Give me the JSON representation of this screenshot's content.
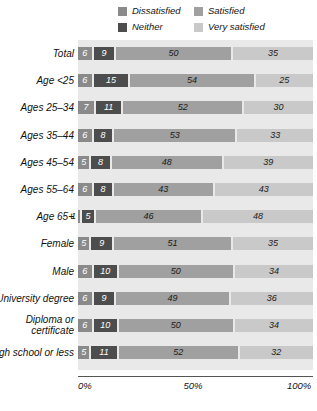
{
  "chart_data": {
    "type": "bar",
    "orientation": "horizontal",
    "stacked": true,
    "normalized_percent": true,
    "title": "",
    "subtitle": "",
    "xlabel": "",
    "ylabel": "",
    "xlim": [
      0,
      100
    ],
    "grid": false,
    "legend_position": "top",
    "colors": {
      "dissatisfied": "#8a8a8a",
      "neither": "#4d4d4d",
      "satisfied": "#a0a0a0",
      "very_satisfied": "#c9c9c9",
      "plot_background": "#e9e9e9",
      "axis_line": "#555555",
      "bar_gap": "#ffffff"
    },
    "series": [
      {
        "name": "Dissatisfied",
        "key": "dissatisfied",
        "color": "#8a8a8a",
        "values": [
          6,
          6,
          7,
          6,
          5,
          6,
          1,
          5,
          6,
          6,
          6,
          5
        ]
      },
      {
        "name": "Neither",
        "key": "neither",
        "color": "#4d4d4d",
        "values": [
          9,
          15,
          11,
          8,
          8,
          8,
          5,
          9,
          10,
          9,
          10,
          11
        ]
      },
      {
        "name": "Satisfied",
        "key": "satisfied",
        "color": "#a0a0a0",
        "values": [
          50,
          54,
          52,
          53,
          48,
          43,
          46,
          51,
          50,
          49,
          50,
          52
        ]
      },
      {
        "name": "Very satisfied",
        "key": "very_satisfied",
        "color": "#c9c9c9",
        "values": [
          35,
          25,
          30,
          33,
          39,
          43,
          48,
          35,
          34,
          36,
          34,
          32
        ]
      }
    ],
    "categories": [
      "Total",
      "Age <25",
      "Ages 25–34",
      "Ages 35–44",
      "Ages 45–54",
      "Ages 55–64",
      "Age 65+",
      "Female",
      "Male",
      "University degree",
      "Diploma or\ncertificate",
      "High school or less"
    ],
    "xticks": [
      0,
      50,
      100
    ],
    "xticklabels": [
      "0%",
      "50%",
      "100%"
    ]
  },
  "legend": {
    "items": [
      {
        "label": "Dissatisfied",
        "swatch_name": "legend-swatch-dissatisfied",
        "color": "#8a8a8a"
      },
      {
        "label": "Satisfied",
        "swatch_name": "legend-swatch-satisfied",
        "color": "#a0a0a0"
      },
      {
        "label": "Neither",
        "swatch_name": "legend-swatch-neither",
        "color": "#4d4d4d"
      },
      {
        "label": "Very satisfied",
        "swatch_name": "legend-swatch-very-satisfied",
        "color": "#c9c9c9"
      }
    ]
  },
  "rows": [
    {
      "label": "Total",
      "values": [
        6,
        9,
        50,
        35
      ],
      "outside_first": false
    },
    {
      "label": "Age <25",
      "values": [
        6,
        15,
        54,
        25
      ],
      "outside_first": false
    },
    {
      "label": "Ages 25–34",
      "values": [
        7,
        11,
        52,
        30
      ],
      "outside_first": false
    },
    {
      "label": "Ages 35–44",
      "values": [
        6,
        8,
        53,
        33
      ],
      "outside_first": false
    },
    {
      "label": "Ages 45–54",
      "values": [
        5,
        8,
        48,
        39
      ],
      "outside_first": false
    },
    {
      "label": "Ages 55–64",
      "values": [
        6,
        8,
        43,
        43
      ],
      "outside_first": false
    },
    {
      "label": "Age 65+",
      "values": [
        1,
        5,
        46,
        48
      ],
      "outside_first": true
    },
    {
      "label": "Female",
      "values": [
        5,
        9,
        51,
        35
      ],
      "outside_first": false
    },
    {
      "label": "Male",
      "values": [
        6,
        10,
        50,
        34
      ],
      "outside_first": false
    },
    {
      "label": "University degree",
      "values": [
        6,
        9,
        49,
        36
      ],
      "outside_first": false
    },
    {
      "label": "Diploma or\ncertificate",
      "values": [
        6,
        10,
        50,
        34
      ],
      "outside_first": false
    },
    {
      "label": "High school or less",
      "values": [
        5,
        11,
        52,
        32
      ],
      "outside_first": false
    }
  ],
  "axis": {
    "ticks": [
      {
        "label": "0%",
        "value": 0
      },
      {
        "label": "50%",
        "value": 50
      },
      {
        "label": "100%",
        "value": 100
      }
    ]
  }
}
